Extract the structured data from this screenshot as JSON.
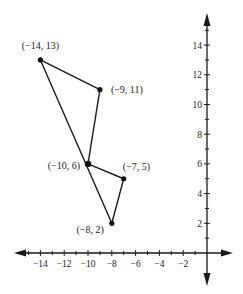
{
  "diagram": {
    "type": "coordinate-plane-polygon",
    "axes": {
      "x_ticks": [
        -14,
        -12,
        -10,
        -8,
        -6,
        -4,
        -2
      ],
      "x_tick_labels": [
        "−14",
        "−12",
        "−10",
        "−8",
        "−6",
        "−4",
        "−2"
      ],
      "y_ticks": [
        2,
        4,
        6,
        8,
        10,
        12,
        14
      ],
      "y_tick_labels": [
        "2",
        "4",
        "6",
        "8",
        "10",
        "12",
        "14"
      ],
      "x_range": [
        -15,
        1
      ],
      "y_range": [
        -2,
        15
      ]
    },
    "points": [
      {
        "id": "A",
        "x": -14,
        "y": 13,
        "label": "(−14, 13)"
      },
      {
        "id": "B",
        "x": -9,
        "y": 11,
        "label": "(−9, 11)"
      },
      {
        "id": "C",
        "x": -10,
        "y": 6,
        "label": "(−10, 6)"
      },
      {
        "id": "D",
        "x": -7,
        "y": 5,
        "label": "(−7, 5)"
      },
      {
        "id": "E",
        "x": -8,
        "y": 2,
        "label": "(−8, 2)"
      }
    ],
    "segments": [
      [
        "A",
        "B"
      ],
      [
        "B",
        "C"
      ],
      [
        "A",
        "E"
      ],
      [
        "C",
        "D"
      ],
      [
        "D",
        "E"
      ]
    ],
    "colors": {
      "line": "#1a1a1a",
      "point": "#111111",
      "axis": "#1a1a1a"
    }
  }
}
